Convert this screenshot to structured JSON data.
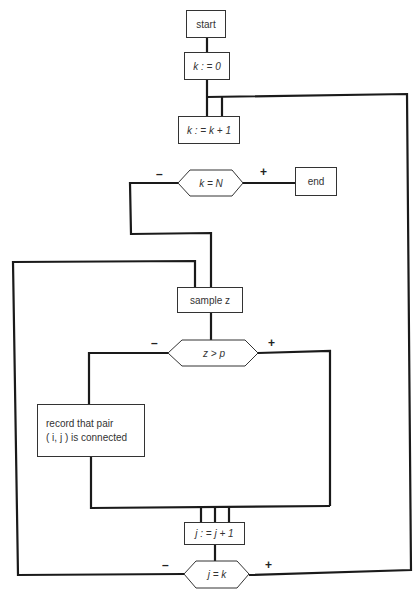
{
  "flowchart": {
    "start": "start",
    "init_k": "k : = 0",
    "increment_k": "k : = k + 1",
    "decision_k_equals_N": "k = N",
    "end": "end",
    "sample": "sample  z",
    "decision_z_gt_p": "z > p",
    "record_line1": "record that  pair",
    "record_line2": "( i,  j )  is connected",
    "increment_j": "j : = j + 1",
    "decision_j_equals_k": "j  =  k",
    "branch_labels": {
      "k_equals_N_no": "–",
      "k_equals_N_yes": "+",
      "z_gt_p_no": "–",
      "z_gt_p_yes": "+",
      "j_equals_k_no": "–",
      "j_equals_k_yes": "+"
    },
    "colors": {
      "line": "#1a1a1a",
      "box_border": "#333333",
      "background": "#ffffff"
    }
  }
}
